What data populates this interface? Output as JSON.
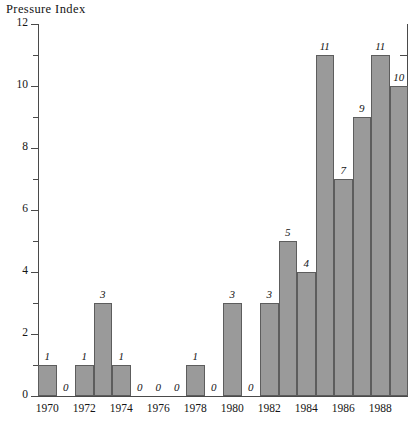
{
  "chart_data": {
    "type": "bar",
    "title": "Pressure  Index",
    "xlabel": "",
    "ylabel": "",
    "ylim": [
      0,
      12
    ],
    "ytick_labels": [
      "0",
      "2",
      "4",
      "6",
      "8",
      "10",
      "12"
    ],
    "ytick_values": [
      0,
      2,
      4,
      6,
      8,
      10,
      12
    ],
    "yminor_values": [
      1,
      3,
      5,
      7,
      9,
      11
    ],
    "grid": false,
    "legend": null,
    "categories": [
      "1970",
      "1971",
      "1972",
      "1973",
      "1974",
      "1975",
      "1976",
      "1977",
      "1978",
      "1979",
      "1980",
      "1981",
      "1982",
      "1983",
      "1984",
      "1985",
      "1986",
      "1987",
      "1988",
      "1989"
    ],
    "values": [
      1,
      0,
      1,
      3,
      1,
      0,
      0,
      0,
      1,
      0,
      3,
      0,
      3,
      5,
      4,
      11,
      7,
      9,
      11,
      10
    ],
    "value_labels": [
      "1",
      "0",
      "1",
      "3",
      "1",
      "0",
      "0",
      "0",
      "1",
      "0",
      "3",
      "0",
      "3",
      "5",
      "4",
      "11",
      "7",
      "9",
      "11",
      "10"
    ],
    "xtick_labels": [
      "1970",
      "1972",
      "1974",
      "1976",
      "1978",
      "1980",
      "1982",
      "1984",
      "1986",
      "1988"
    ],
    "xtick_categories": [
      "1970",
      "1972",
      "1974",
      "1976",
      "1978",
      "1980",
      "1982",
      "1984",
      "1986",
      "1988"
    ],
    "colors": {
      "bar_fill": "#9a9a9a",
      "bar_edge": "#5d5d5d",
      "axis": "#4a4a4a",
      "text": "#141414",
      "background": "#ffffff"
    }
  }
}
